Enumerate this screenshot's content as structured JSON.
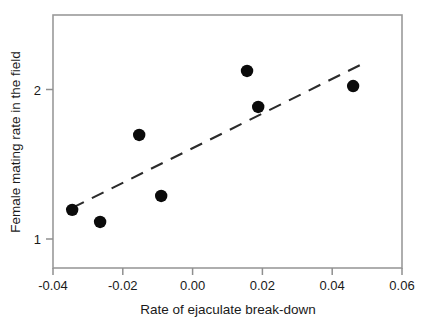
{
  "chart_data": {
    "type": "scatter",
    "title": "",
    "xlabel": "Rate of ejaculate break-down",
    "ylabel": "Female mating rate in the field",
    "xlim": [
      -0.04,
      0.06
    ],
    "ylim": [
      0.78,
      2.39
    ],
    "grid": false,
    "legend": null,
    "xticks": [
      -0.04,
      -0.02,
      0.0,
      0.02,
      0.04,
      0.06
    ],
    "xticklabels": [
      "-0.04",
      "-0.02",
      "0.00",
      "0.02",
      "0.04",
      "0.06"
    ],
    "yticks": [
      1,
      2
    ],
    "yticklabels": [
      "1",
      "2"
    ],
    "points": [
      {
        "x": -0.0345,
        "y": 1.195
      },
      {
        "x": -0.0265,
        "y": 1.114
      },
      {
        "x": -0.0153,
        "y": 1.696
      },
      {
        "x": -0.009,
        "y": 1.288
      },
      {
        "x": 0.0156,
        "y": 2.124
      },
      {
        "x": 0.0188,
        "y": 1.883
      },
      {
        "x": 0.046,
        "y": 2.023
      }
    ],
    "marker": {
      "shape": "circle",
      "color": "#0b0b0b",
      "size_px": 6.2
    },
    "trendline": {
      "style": "dashed",
      "color": "#2b2b2b",
      "x_start": -0.0345,
      "y_start": 1.208,
      "x_end": 0.049,
      "y_end": 2.175
    },
    "annotations": []
  },
  "figure": {
    "background": "#ffffff",
    "frame_color": "#9a9a9a",
    "text_color": "#1a1a1a"
  }
}
